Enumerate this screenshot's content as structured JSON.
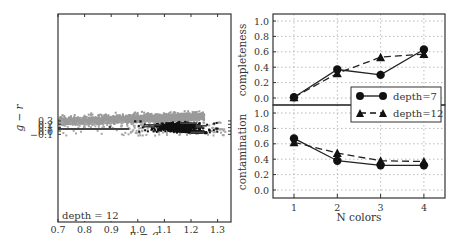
{
  "chart_data": [
    {
      "type": "scatter",
      "title": "",
      "xlabel": "u - g",
      "ylabel": "g - r",
      "xlim": [
        0.7,
        1.35
      ],
      "ylim": [
        -0.15,
        0.39
      ],
      "xticks": [
        "0.7",
        "0.8",
        "0.9",
        "1.0",
        "1.1",
        "1.2",
        "1.3"
      ],
      "yticks": [
        "-0.1",
        "0.0",
        "0.1",
        "0.2",
        "0.3"
      ],
      "annotation": "depth = 12",
      "grid": false,
      "series": [
        {
          "name": "background (gray)",
          "color": "#9a9a9a",
          "description": "dense gray cloud at upper-left (g-r > 0.2, u-g < 1.2) plus sparse gray points"
        },
        {
          "name": "selected (black)",
          "color": "#111111",
          "description": "black cluster centered near u-g ~ 1.15, g-r ~ 0.12, extending to g-r ~ -0.05 at u-g ~ 1.22"
        }
      ],
      "decision_boundary": "dark step-like boundary lines (decision tree, depth 12): horizontal line at g-r ~ 0.06 from u-g 0.7 to ~0.97 with a spike near u-g ~ 0.9"
    },
    {
      "type": "line",
      "panel": "top",
      "xlabel": "",
      "ylabel": "completeness",
      "categories": [
        1,
        2,
        3,
        4
      ],
      "ylim": [
        -0.05,
        1.1
      ],
      "yticks": [
        "0.0",
        "0.2",
        "0.4",
        "0.6",
        "0.8",
        "1.0"
      ],
      "grid": true,
      "series": [
        {
          "name": "depth=7",
          "marker": "circle",
          "linestyle": "solid",
          "values": [
            0.01,
            0.37,
            0.3,
            0.63
          ]
        },
        {
          "name": "depth=12",
          "marker": "triangle",
          "linestyle": "dashed",
          "values": [
            0.01,
            0.32,
            0.53,
            0.57
          ]
        }
      ]
    },
    {
      "type": "line",
      "panel": "bottom",
      "xlabel": "N colors",
      "ylabel": "contamination",
      "categories": [
        1,
        2,
        3,
        4
      ],
      "xticks": [
        "1",
        "2",
        "3",
        "4"
      ],
      "ylim": [
        -0.05,
        1.1
      ],
      "yticks": [
        "0.0",
        "0.2",
        "0.4",
        "0.6",
        "0.8",
        "1.0"
      ],
      "grid": true,
      "legend": {
        "position": "center-right, straddling panels",
        "entries": [
          "depth=7",
          "depth=12"
        ]
      },
      "series": [
        {
          "name": "depth=7",
          "marker": "circle",
          "linestyle": "solid",
          "values": [
            0.67,
            0.38,
            0.32,
            0.32
          ]
        },
        {
          "name": "depth=12",
          "marker": "triangle",
          "linestyle": "dashed",
          "values": [
            0.62,
            0.48,
            0.38,
            0.37
          ]
        }
      ]
    }
  ],
  "left": {
    "xlabel": "u − g",
    "ylabel": "g − r",
    "annotation": "depth = 12",
    "xticks": [
      "0.7",
      "0.8",
      "0.9",
      "1.0",
      "1.1",
      "1.2",
      "1.3"
    ],
    "yticks": [
      "−0.1",
      "0.0",
      "0.1",
      "0.2",
      "0.3"
    ]
  },
  "right": {
    "top_ylabel": "completeness",
    "bottom_ylabel": "contamination",
    "xlabel": "N colors",
    "xticks": [
      "1",
      "2",
      "3",
      "4"
    ],
    "yticks": [
      "0.0",
      "0.2",
      "0.4",
      "0.6",
      "0.8",
      "1.0"
    ],
    "legend": [
      "depth=7",
      "depth=12"
    ]
  },
  "colors": {
    "gray_points": "#9a9a9a",
    "black_points": "#111111",
    "grid": "#aaaaaa",
    "axes": "#333333"
  }
}
